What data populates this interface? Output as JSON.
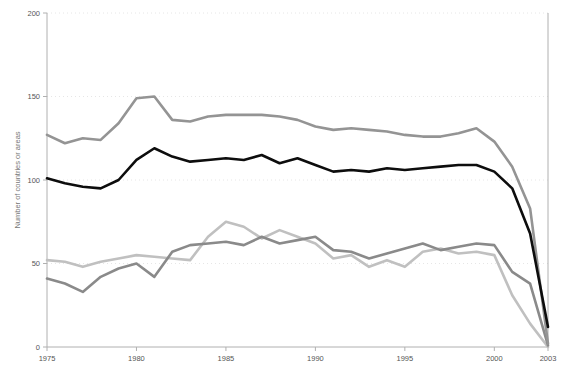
{
  "chart_data": {
    "type": "line",
    "title": "",
    "subtitle": "",
    "xlabel": "",
    "ylabel": "Number of countries or areas",
    "xlim": [
      1975,
      2003
    ],
    "ylim": [
      0,
      200
    ],
    "grid": true,
    "legend_position": "none",
    "x_tick_labels": [
      "1975",
      "1980",
      "1985",
      "1990",
      "1995",
      "2000",
      "2003"
    ],
    "x_ticks": [
      1975,
      1980,
      1985,
      1990,
      1995,
      2000,
      2003
    ],
    "y_tick_labels": [
      "0",
      "50",
      "100",
      "150",
      "200"
    ],
    "y_ticks": [
      0,
      50,
      100,
      150,
      200
    ],
    "x": [
      1975,
      1976,
      1977,
      1978,
      1979,
      1980,
      1981,
      1982,
      1983,
      1984,
      1985,
      1986,
      1987,
      1988,
      1989,
      1990,
      1991,
      1992,
      1993,
      1994,
      1995,
      1996,
      1997,
      1998,
      1999,
      2000,
      2001,
      2002,
      2003
    ],
    "series": [
      {
        "name": "series-upper-gray",
        "color": "#949494",
        "values": [
          127,
          122,
          125,
          124,
          134,
          149,
          150,
          136,
          135,
          138,
          139,
          139,
          139,
          138,
          136,
          132,
          130,
          131,
          130,
          129,
          127,
          126,
          126,
          128,
          131,
          123,
          108,
          83,
          2
        ]
      },
      {
        "name": "series-black",
        "color": "#0d0d0d",
        "values": [
          101,
          98,
          96,
          95,
          100,
          112,
          119,
          114,
          111,
          112,
          113,
          112,
          115,
          110,
          113,
          109,
          105,
          106,
          105,
          107,
          106,
          107,
          108,
          109,
          109,
          105,
          95,
          68,
          12
        ]
      },
      {
        "name": "series-mid-gray",
        "color": "#8a8a8a",
        "values": [
          41,
          38,
          33,
          42,
          47,
          50,
          42,
          57,
          61,
          62,
          63,
          61,
          66,
          62,
          64,
          66,
          58,
          57,
          53,
          56,
          59,
          62,
          58,
          60,
          62,
          61,
          45,
          38,
          1
        ]
      },
      {
        "name": "series-light-gray",
        "color": "#c0c0c0",
        "values": [
          52,
          51,
          48,
          51,
          53,
          55,
          54,
          53,
          52,
          66,
          75,
          72,
          65,
          70,
          66,
          62,
          53,
          55,
          48,
          52,
          48,
          57,
          59,
          56,
          57,
          55,
          31,
          14,
          0
        ]
      }
    ]
  },
  "plot": {
    "left": 47,
    "right": 548,
    "top": 13,
    "bottom": 347
  }
}
